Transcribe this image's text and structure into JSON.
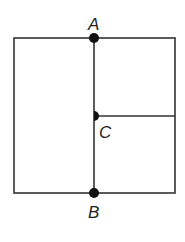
{
  "diagram": {
    "type": "geometry-figure",
    "colors": {
      "line": "#333333",
      "point": "#111111",
      "label": "#222222",
      "background": "#ffffff"
    },
    "points": [
      {
        "label": "A",
        "x": 94,
        "y": 38
      },
      {
        "label": "B",
        "x": 94,
        "y": 193
      },
      {
        "label": "C",
        "x": 94,
        "y": 116
      }
    ],
    "labels": {
      "a": "A",
      "b": "B",
      "c": "C"
    }
  }
}
